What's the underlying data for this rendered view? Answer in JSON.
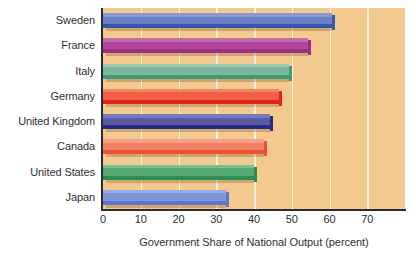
{
  "chart_data": {
    "type": "bar",
    "orientation": "horizontal",
    "title": "",
    "xlabel": "Government Share of National Output (percent)",
    "ylabel": "",
    "categories": [
      "Sweden",
      "France",
      "Italy",
      "Germany",
      "United Kingdom",
      "Canada",
      "United States",
      "Japan"
    ],
    "values": [
      60.7,
      54.2,
      49.3,
      46.5,
      44.2,
      42.7,
      39.9,
      32.7
    ],
    "series": [
      {
        "name": "Government Share of National Output",
        "values": [
          60.7,
          54.2,
          49.3,
          46.5,
          44.2,
          42.7,
          39.9,
          32.7
        ]
      }
    ],
    "bar_colors": [
      "#6b80c6",
      "#b2479b",
      "#7fb79e",
      "#ef6142",
      "#5a5aa6",
      "#f28265",
      "#55a871",
      "#8096dc"
    ],
    "bar_colors_top": [
      "#8a9bd4",
      "#c46bae",
      "#9ecab4",
      "#f4836a",
      "#7878bd",
      "#f5a089",
      "#7bbe92",
      "#9aaae5"
    ],
    "bar_colors_bottom": [
      "#3558ad",
      "#9c2f84",
      "#3f9a78",
      "#e3231b",
      "#2a2a87",
      "#ee5236",
      "#2b8f52",
      "#5f77cb"
    ],
    "xlim": [
      0,
      80
    ],
    "xticks": [
      0,
      10,
      20,
      30,
      40,
      50,
      60,
      70
    ],
    "xtick_labels": [
      "0",
      "10",
      "20",
      "30",
      "40",
      "50",
      "60",
      "70"
    ],
    "gridlines": [
      10,
      20,
      30,
      40,
      50,
      60,
      70
    ],
    "grid": true,
    "grid_axis": "x",
    "legend": false,
    "plot_background": "#f3c98f",
    "gridline_color": "#fbf1da",
    "axis_color": "#2b2b30",
    "text_color": "#2f2f33",
    "page_background": "#ffffff"
  },
  "axis": {
    "x_title": "Government Share of National Output (percent)"
  }
}
